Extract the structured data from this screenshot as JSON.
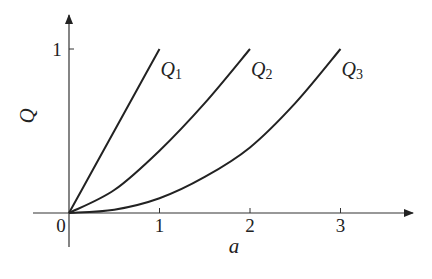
{
  "chart_data": {
    "type": "line",
    "title": "",
    "xlabel": "a",
    "ylabel": "Q",
    "x_ticks": [
      "0",
      "1",
      "2",
      "3"
    ],
    "y_ticks": [
      "1"
    ],
    "xlim": [
      -0.4,
      3.85
    ],
    "ylim": [
      -0.2,
      1.2
    ],
    "grid": false,
    "legend": "inline labels at curve ends",
    "series": [
      {
        "name": "Q1",
        "label_main": "Q",
        "label_sub": "1",
        "x": [
          0,
          0.25,
          0.5,
          0.75,
          1.0
        ],
        "y": [
          0,
          0.25,
          0.5,
          0.75,
          1.0
        ]
      },
      {
        "name": "Q2",
        "label_main": "Q",
        "label_sub": "2",
        "x": [
          0,
          0.5,
          1.0,
          1.5,
          2.0
        ],
        "y": [
          0,
          0.14,
          0.38,
          0.67,
          1.0
        ]
      },
      {
        "name": "Q3",
        "label_main": "Q",
        "label_sub": "3",
        "x": [
          0,
          0.5,
          1.0,
          1.5,
          2.0,
          2.5,
          3.0
        ],
        "y": [
          0,
          0.02,
          0.09,
          0.22,
          0.4,
          0.67,
          1.0
        ]
      }
    ]
  }
}
